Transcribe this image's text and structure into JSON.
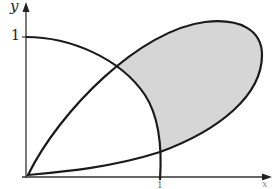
{
  "figure": {
    "axis_labels": {
      "y": "y",
      "x": "x"
    },
    "tick_labels": {
      "y_one": "1",
      "x_one": "1"
    },
    "curves": [
      {
        "name": "quarter-circle",
        "description": "arc from (0,1) down to (1,0)"
      },
      {
        "name": "closed-loop",
        "description": "teardrop-shaped loop starting at origin"
      }
    ],
    "shaded_region": "part of loop outside the quarter circle",
    "colors": {
      "stroke": "#1a1a1a",
      "fill": "#d6d6d6",
      "background": "#ffffff"
    }
  }
}
